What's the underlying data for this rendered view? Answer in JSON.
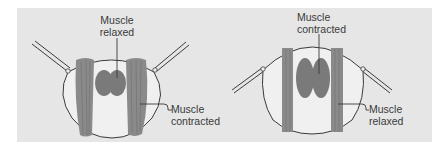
{
  "colors": {
    "page_bg": "#ffffff",
    "panel_bg": "#e6e6e6",
    "eye_fill": "#f2f2f2",
    "outline": "#3a3a3a",
    "muscle": "#8a8a8a",
    "muscle_dark": "#6e6e6e",
    "lens": "#7a7a7a",
    "text": "#3a3a3a"
  },
  "panels": [
    {
      "id": "left",
      "state": "muscle-relaxed-center",
      "labels": {
        "top": {
          "line1": "Muscle",
          "line2": "relaxed"
        },
        "side": {
          "line1": "Muscle",
          "line2": "contracted"
        }
      }
    },
    {
      "id": "right",
      "state": "muscle-contracted-center",
      "labels": {
        "top": {
          "line1": "Muscle",
          "line2": "contracted"
        },
        "side": {
          "line1": "Muscle",
          "line2": "relaxed"
        }
      }
    }
  ]
}
